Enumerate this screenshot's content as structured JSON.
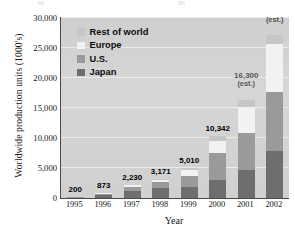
{
  "chart_data": {
    "type": "bar",
    "subtype": "stacked-bar",
    "title": "",
    "xlabel": "Year",
    "ylabel": "Worldwide production units (1000's)",
    "categories": [
      "1995",
      "1996",
      "1997",
      "1998",
      "1999",
      "2000",
      "2001",
      "2002"
    ],
    "ylim": [
      0,
      30000
    ],
    "yticks": [
      "0",
      "5,000",
      "10,000",
      "15,000",
      "20,000",
      "25,000",
      "30,000"
    ],
    "ytick_values": [
      0,
      5000,
      10000,
      15000,
      20000,
      25000,
      30000
    ],
    "grid": true,
    "legend_position": "upper-left-inside",
    "series": [
      {
        "name": "Japan",
        "color": "#6e6e6e",
        "values": [
          150,
          520,
          1150,
          1700,
          1750,
          3050,
          4600,
          7800
        ]
      },
      {
        "name": "U.S.",
        "color": "#9a9a9a",
        "values": [
          40,
          220,
          700,
          900,
          1950,
          4450,
          6150,
          9700
        ]
      },
      {
        "name": "Europe",
        "color": "#f2f2f2",
        "values": [
          8,
          90,
          260,
          420,
          900,
          2000,
          4400,
          8000
        ]
      },
      {
        "name": "Rest of world",
        "color": "#c6c6c6",
        "values": [
          2,
          43,
          120,
          151,
          410,
          842,
          1150,
          1500
        ]
      }
    ],
    "data_labels": [
      {
        "category": "1995",
        "text": "200",
        "est": false,
        "est_text": ""
      },
      {
        "category": "1996",
        "text": "873",
        "est": false,
        "est_text": ""
      },
      {
        "category": "1997",
        "text": "2,230",
        "est": false,
        "est_text": ""
      },
      {
        "category": "1998",
        "text": "3,171",
        "est": false,
        "est_text": ""
      },
      {
        "category": "1999",
        "text": "5,010",
        "est": false,
        "est_text": ""
      },
      {
        "category": "2000",
        "text": "10,342",
        "est": false,
        "est_text": ""
      },
      {
        "category": "2001",
        "text": "16,300",
        "est": true,
        "est_text": "(est.)"
      },
      {
        "category": "2002",
        "text": "27,000",
        "est": true,
        "est_text": "(est.)"
      }
    ],
    "totals": [
      200,
      873,
      2230,
      3171,
      5010,
      10342,
      16300,
      27000
    ]
  },
  "legend": {
    "items": [
      {
        "label": "Rest of world",
        "color": "#c6c6c6"
      },
      {
        "label": "Europe",
        "color": "#f2f2f2"
      },
      {
        "label": "U.S.",
        "color": "#9a9a9a"
      },
      {
        "label": "Japan",
        "color": "#6e6e6e"
      }
    ]
  },
  "axes": {
    "y_title": "Worldwide production units (1000's)",
    "x_title": "Year",
    "y_labels": [
      "30,000",
      "25,000",
      "20,000",
      "15,000",
      "10,000",
      "5,000",
      "0"
    ],
    "x_labels": [
      "1995",
      "1996",
      "1997",
      "1998",
      "1999",
      "2000",
      "2001",
      "2002"
    ]
  }
}
